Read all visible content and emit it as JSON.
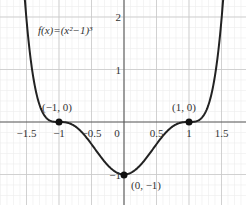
{
  "chart_data": {
    "type": "line",
    "title": "f(x)=(x²−1)³",
    "function_label": "f(x)=(x²−1)³",
    "xlabel": "",
    "ylabel": "",
    "xlim": [
      -1.75,
      1.8
    ],
    "ylim": [
      -1.5,
      2.3
    ],
    "grid": true,
    "x_ticks": [
      "−1.5",
      "−1",
      "−0.5",
      "0",
      "0.5",
      "1",
      "1.5"
    ],
    "y_ticks": [
      "2",
      "1",
      "−1"
    ],
    "series": [
      {
        "name": "f(x)=(x²−1)³",
        "x": [
          -1.5,
          -1.25,
          -1,
          -0.75,
          -0.5,
          -0.25,
          0,
          0.25,
          0.5,
          0.75,
          1,
          1.25,
          1.5
        ],
        "values": [
          1.95,
          0.18,
          0,
          -0.08,
          -0.42,
          -0.83,
          -1,
          -0.83,
          -0.42,
          -0.08,
          0,
          0.18,
          1.95
        ]
      }
    ],
    "annotations": [
      {
        "label": "(−1, 0)",
        "x": -1,
        "y": 0
      },
      {
        "label": "(1, 0)",
        "x": 1,
        "y": 0
      },
      {
        "label": "(0, −1)",
        "x": 0,
        "y": -1
      }
    ]
  }
}
